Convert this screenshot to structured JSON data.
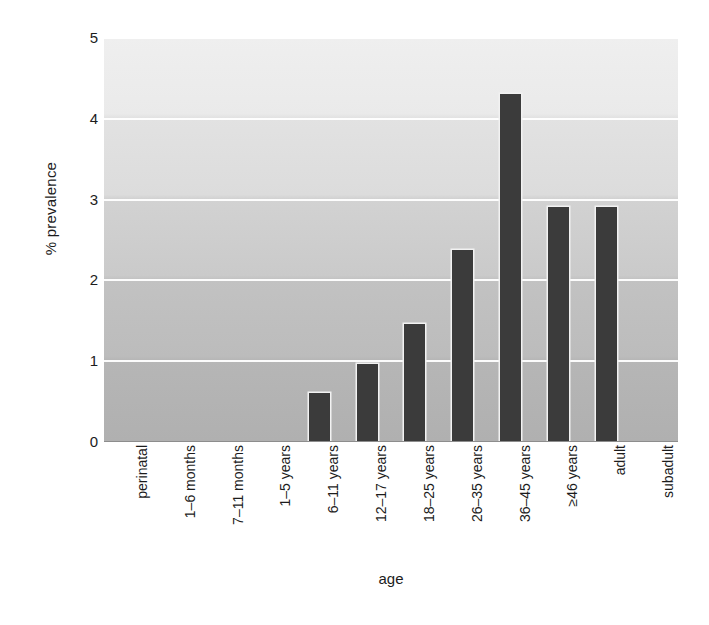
{
  "chart_data": {
    "type": "bar",
    "title": "",
    "xlabel": "age",
    "ylabel": "% prevalence",
    "ylim": [
      0,
      5
    ],
    "yticks": [
      0,
      1,
      2,
      3,
      4,
      5
    ],
    "ytick_labels": [
      "0",
      "1",
      "2",
      "3",
      "4",
      "5"
    ],
    "grid": true,
    "grid_axis": "y",
    "grid_color": "#ffffff",
    "legend": false,
    "legend_position": "none",
    "bar_color": "#3b3b3b",
    "plot_background": "vertical-gradient-light-to-dark",
    "categories": [
      "perinatal",
      "1–6 months",
      "7–11 months",
      "1–5 years",
      "6–11 years",
      "12–17 years",
      "18–25 years",
      "26–35 years",
      "36–45 years",
      "≥46 years",
      "adult",
      "subadult"
    ],
    "values": [
      0,
      0,
      0,
      0,
      0.6,
      0.95,
      1.45,
      2.37,
      4.3,
      2.9,
      2.9,
      0
    ]
  }
}
